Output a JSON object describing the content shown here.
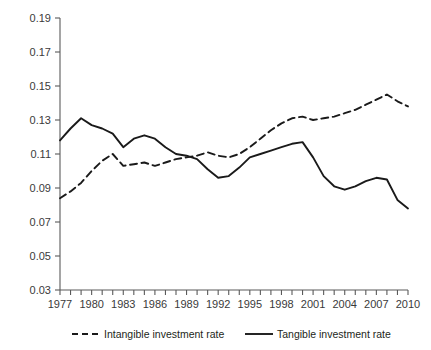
{
  "chart_data": {
    "type": "line",
    "title": "",
    "xlabel": "",
    "ylabel": "",
    "grid": false,
    "legend_position": "bottom",
    "x": [
      1977,
      1978,
      1979,
      1980,
      1981,
      1982,
      1983,
      1984,
      1985,
      1986,
      1987,
      1988,
      1989,
      1990,
      1991,
      1992,
      1993,
      1994,
      1995,
      1996,
      1997,
      1998,
      1999,
      2000,
      2001,
      2002,
      2003,
      2004,
      2005,
      2006,
      2007,
      2008,
      2009,
      2010
    ],
    "xlim": [
      1977,
      2010
    ],
    "ylim": [
      0.03,
      0.19
    ],
    "ytick_labels": [
      "0.19",
      "0.17",
      "0.15",
      "0.13",
      "0.11",
      "0.09",
      "0.07",
      "0.05",
      "0.03"
    ],
    "ytick_values": [
      0.19,
      0.17,
      0.15,
      0.13,
      0.11,
      0.09,
      0.07,
      0.05,
      0.03
    ],
    "xtick_labels": [
      "1977",
      "1980",
      "1983",
      "1986",
      "1989",
      "1992",
      "1995",
      "1998",
      "2001",
      "2004",
      "2007",
      "2010"
    ],
    "xtick_values": [
      1977,
      1980,
      1983,
      1986,
      1989,
      1992,
      1995,
      1998,
      2001,
      2004,
      2007,
      2010
    ],
    "series": [
      {
        "name": "Intangible investment rate",
        "style": "dashed",
        "color": "#1a1a1a",
        "values": [
          0.084,
          0.088,
          0.093,
          0.1,
          0.106,
          0.11,
          0.103,
          0.104,
          0.105,
          0.103,
          0.105,
          0.107,
          0.108,
          0.109,
          0.111,
          0.109,
          0.108,
          0.11,
          0.114,
          0.119,
          0.124,
          0.128,
          0.131,
          0.132,
          0.13,
          0.131,
          0.132,
          0.134,
          0.136,
          0.139,
          0.142,
          0.145,
          0.141,
          0.138
        ]
      },
      {
        "name": "Tangible investment rate",
        "style": "solid",
        "color": "#1a1a1a",
        "values": [
          0.118,
          0.125,
          0.131,
          0.127,
          0.125,
          0.122,
          0.114,
          0.119,
          0.121,
          0.119,
          0.114,
          0.11,
          0.109,
          0.107,
          0.101,
          0.096,
          0.097,
          0.102,
          0.108,
          0.11,
          0.112,
          0.114,
          0.116,
          0.117,
          0.108,
          0.097,
          0.091,
          0.089,
          0.091,
          0.094,
          0.096,
          0.095,
          0.083,
          0.078
        ]
      }
    ]
  },
  "legend": {
    "items": [
      {
        "label": "Intangible investment rate",
        "style": "dashed"
      },
      {
        "label": "Tangible investment rate",
        "style": "solid"
      }
    ]
  }
}
